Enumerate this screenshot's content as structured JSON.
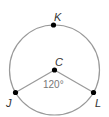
{
  "diagram": {
    "type": "circle-central-angle",
    "center_label": "C",
    "points": [
      {
        "label": "K",
        "position": "top"
      },
      {
        "label": "J",
        "position": "lower-left"
      },
      {
        "label": "L",
        "position": "lower-right"
      }
    ],
    "angle_label": "120°",
    "colors": {
      "circle": "#999999",
      "radius": "#999999",
      "point": "#000000",
      "text": "#333333",
      "angle_text": "#777777"
    }
  }
}
